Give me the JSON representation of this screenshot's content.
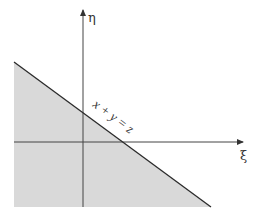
{
  "diagram": {
    "type": "half-plane region",
    "axes": {
      "horizontal_label": "ξ",
      "vertical_label": "η"
    },
    "boundary_label": "x + y = z",
    "region": "shaded area below line x + y = z",
    "colors": {
      "shade": "#d9d9d9",
      "line": "#2b2b2b",
      "axis": "#444444",
      "background": "#ffffff"
    }
  }
}
